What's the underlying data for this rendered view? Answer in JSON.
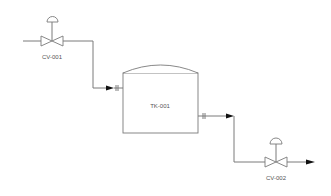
{
  "diagram": {
    "type": "P&ID",
    "colors": {
      "line": "#7a7a7a",
      "arrow": "#111111",
      "text": "#555555",
      "background": "#ffffff"
    },
    "equipment": [
      {
        "id": "CV-001",
        "kind": "control-valve",
        "label": "CV-001"
      },
      {
        "id": "TK-001",
        "kind": "tank",
        "label": "TK-001"
      },
      {
        "id": "CV-002",
        "kind": "control-valve",
        "label": "CV-002"
      }
    ],
    "connections": [
      {
        "from": "inlet",
        "to": "CV-001"
      },
      {
        "from": "CV-001",
        "to": "TK-001",
        "flange": true
      },
      {
        "from": "TK-001",
        "to": "CV-002",
        "flange": true
      },
      {
        "from": "CV-002",
        "to": "outlet"
      }
    ]
  }
}
